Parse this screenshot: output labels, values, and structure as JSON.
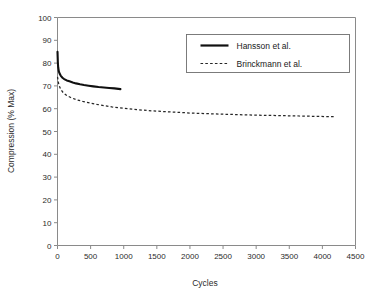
{
  "chart_data": {
    "type": "line",
    "title": "",
    "xlabel": "Cycles",
    "ylabel": "Compression (% Max)",
    "xlim": [
      0,
      4500
    ],
    "ylim": [
      0,
      100
    ],
    "xticks": [
      0,
      500,
      1000,
      1500,
      2000,
      2500,
      3000,
      3500,
      4000,
      4500
    ],
    "xtick_labels": [
      "0",
      "500",
      "1000",
      "1500",
      "2000",
      "2500",
      "3000",
      "3500",
      "4000",
      "4500"
    ],
    "yticks": [
      0,
      10,
      20,
      30,
      40,
      50,
      60,
      70,
      80,
      90,
      100
    ],
    "ytick_labels": [
      "0",
      "10",
      "20",
      "30",
      "40",
      "50",
      "60",
      "70",
      "80",
      "90",
      "100"
    ],
    "grid": false,
    "legend_position": "upper center",
    "series": [
      {
        "name": "Hansson et al.",
        "style": "solid",
        "color": "#101010",
        "x": [
          0,
          5,
          10,
          20,
          35,
          50,
          75,
          100,
          140,
          180,
          230,
          280,
          340,
          400,
          470,
          540,
          620,
          700,
          780,
          860,
          950
        ],
        "y": [
          85.0,
          80.5,
          78.2,
          76.4,
          75.2,
          74.4,
          73.6,
          73.0,
          72.4,
          72.0,
          71.5,
          71.1,
          70.7,
          70.4,
          70.1,
          69.8,
          69.5,
          69.3,
          69.1,
          68.9,
          68.6
        ]
      },
      {
        "name": "Brinckmann et al.",
        "style": "dashed",
        "color": "#262626",
        "x": [
          0,
          20,
          50,
          90,
          140,
          200,
          280,
          380,
          500,
          650,
          820,
          1000,
          1200,
          1450,
          1700,
          2000,
          2300,
          2600,
          2950,
          3300,
          3650,
          3950,
          4200
        ],
        "y": [
          74.0,
          70.5,
          68.4,
          66.9,
          65.8,
          64.9,
          64.0,
          63.2,
          62.4,
          61.6,
          60.8,
          60.2,
          59.6,
          59.0,
          58.6,
          58.1,
          57.8,
          57.5,
          57.2,
          57.0,
          56.8,
          56.6,
          56.5
        ]
      }
    ]
  },
  "legend": {
    "entries": [
      {
        "label": "Hansson et al.",
        "style": "solid"
      },
      {
        "label": "Brinckmann et al.",
        "style": "dashed"
      }
    ]
  },
  "axes": {
    "x_title": "Cycles",
    "y_title": "Compression (% Max)"
  }
}
